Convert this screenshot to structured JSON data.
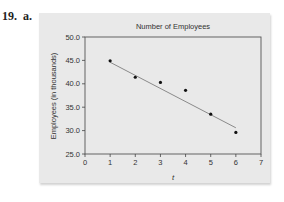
{
  "problem": {
    "label": "19.  a."
  },
  "colors": {
    "panel_bg": "#e9e9e9",
    "axis": "#444444",
    "point": "#111111",
    "trend_line": "#8a8a8a",
    "text": "#333333"
  },
  "chart_data": {
    "type": "scatter",
    "title": "Number of Employees",
    "xlabel": "t",
    "ylabel": "Employees (in thousands)",
    "xlim": [
      0,
      7
    ],
    "ylim": [
      25.0,
      50.0
    ],
    "x_ticks": [
      "0",
      "1",
      "2",
      "3",
      "4",
      "5",
      "6",
      "7"
    ],
    "y_ticks": [
      "25.0",
      "30.0",
      "35.0",
      "40.0",
      "45.0",
      "50.0"
    ],
    "grid": false,
    "legend": null,
    "series": [
      {
        "name": "Employees",
        "x": [
          1,
          2,
          3,
          4,
          5,
          6
        ],
        "y": [
          44.9,
          41.4,
          40.3,
          38.6,
          33.5,
          29.6
        ]
      }
    ],
    "trend_line": {
      "type": "linear regression",
      "x_start": 1,
      "y_start": 44.6,
      "x_end": 6,
      "y_end": 30.6
    }
  }
}
